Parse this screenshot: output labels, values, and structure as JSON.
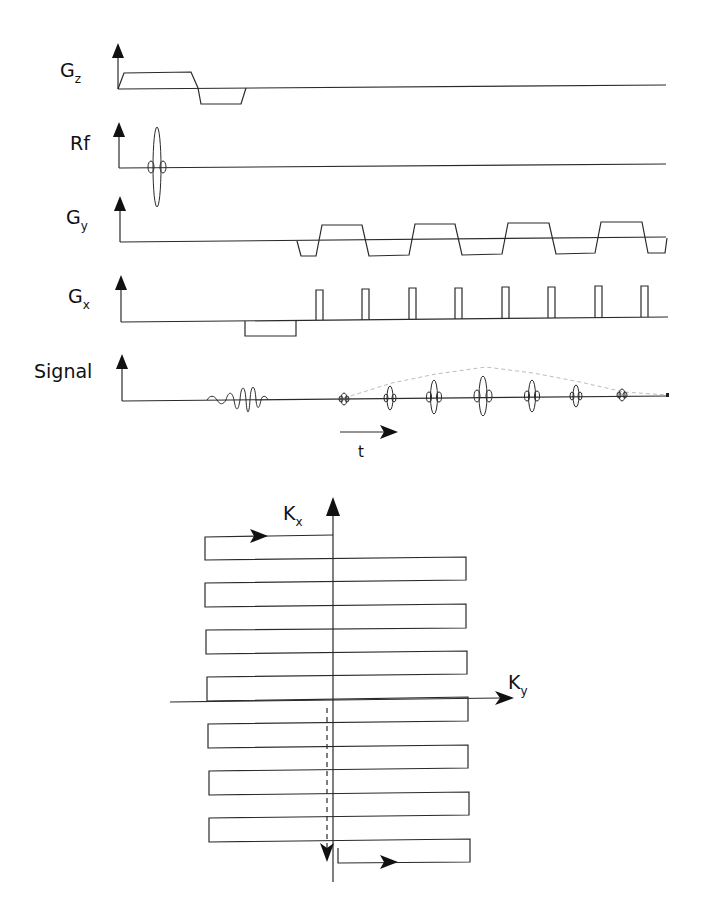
{
  "pulse_sequence": {
    "rows": [
      {
        "id": "gz",
        "label_main": "G",
        "label_sub": "z"
      },
      {
        "id": "rf",
        "label_main": "Rf",
        "label_sub": ""
      },
      {
        "id": "gy",
        "label_main": "G",
        "label_sub": "y"
      },
      {
        "id": "gx",
        "label_main": "G",
        "label_sub": "x"
      },
      {
        "id": "signal",
        "label_main": "Signal",
        "label_sub": ""
      }
    ],
    "time_axis": {
      "label": "t",
      "icon": "right-arrow-icon"
    },
    "gy_lobes_count": 4,
    "gx_blips_count": 8,
    "echo_count": 8
  },
  "k_space": {
    "vertical_axis": {
      "label_main": "K",
      "label_sub": "x"
    },
    "horizontal_axis": {
      "label_main": "K",
      "label_sub": "y"
    },
    "trajectory_lines": 9,
    "icons": [
      "trajectory-direction-arrow-icon",
      "phase-blip-dashed-arrow-icon"
    ]
  }
}
